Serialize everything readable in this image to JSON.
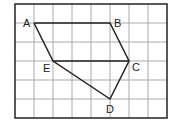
{
  "grid": {
    "cols": 8,
    "rows": 6,
    "x0": 15,
    "y0": 4,
    "cell": 19,
    "line_color": "#aaaaaa",
    "border_color": "#222222"
  },
  "polygon": {
    "order": [
      "A",
      "B",
      "C",
      "D",
      "E"
    ],
    "closing_segment": [
      "E",
      "A"
    ],
    "extra_segment": [
      "E",
      "C"
    ]
  },
  "points": {
    "A": {
      "label": "A",
      "col": 1,
      "row": 1
    },
    "B": {
      "label": "B",
      "col": 5,
      "row": 1
    },
    "C": {
      "label": "C",
      "col": 6,
      "row": 3
    },
    "D": {
      "label": "D",
      "col": 5,
      "row": 5
    },
    "E": {
      "label": "E",
      "col": 2,
      "row": 3
    }
  }
}
